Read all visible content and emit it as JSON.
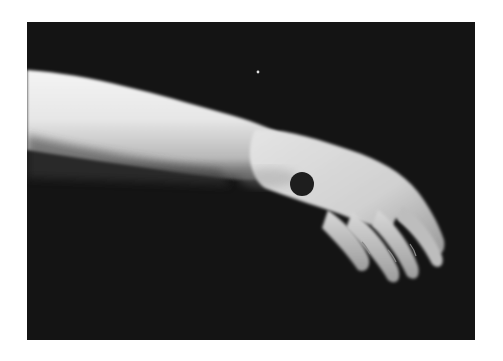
{
  "image": {
    "subject": "arm-and-hand-with-marker",
    "description": "Grayscale photograph of an extended forearm and hand against a black background, with a black circular marker on the back of the hand",
    "colors": {
      "background": "#141414",
      "skin_highlight": "#f2f2f2",
      "skin_mid": "#c8c8c8",
      "skin_shadow": "#7a7a7a",
      "marker": "#1e1e1e",
      "page": "#ffffff"
    },
    "marker": {
      "shape": "circle",
      "cx": 302,
      "cy": 184,
      "r": 12
    }
  }
}
